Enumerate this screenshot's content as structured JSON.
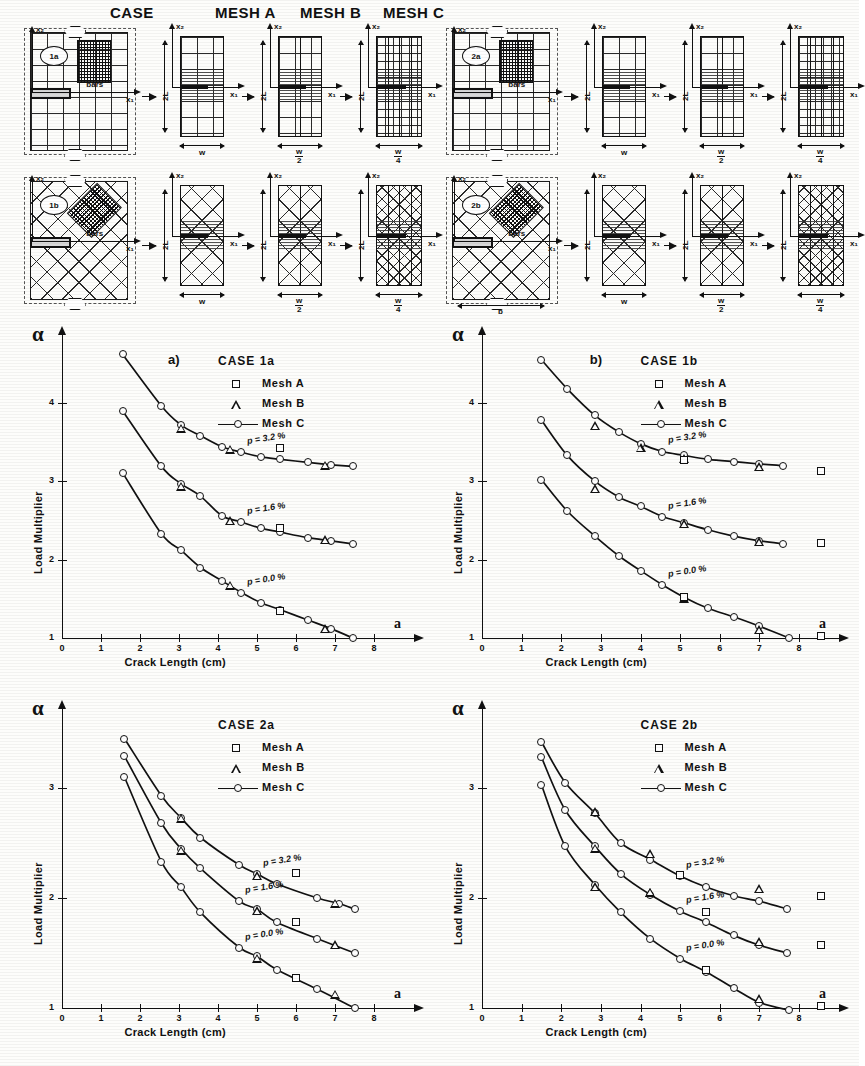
{
  "figure": {
    "headers": [
      "CASE",
      "MESH A",
      "MESH B",
      "MESH C"
    ],
    "case_labels": [
      "1a",
      "1b",
      "2a",
      "2b"
    ],
    "annotations": {
      "bars": "bars",
      "x1": "x₁",
      "x2": "x₂",
      "w": "w",
      "w_over_2_num": "w",
      "w_over_2_den": "2",
      "w_over_4_num": "w",
      "w_over_4_den": "4",
      "two_L": "2L",
      "b": "b"
    }
  },
  "charts": [
    {
      "panel_letter": "a)",
      "case_title": "CASE 1a",
      "alpha_symbol": "α",
      "x_axis_symbol": "a",
      "legend": [
        {
          "marker": "square",
          "label": "Mesh A"
        },
        {
          "marker": "triangle",
          "label": "Mesh B"
        },
        {
          "marker": "line-circle",
          "label": "Mesh C"
        }
      ],
      "chart_data": {
        "type": "line",
        "title": "CASE 1a",
        "xlabel": "Crack Length   (cm)",
        "ylabel": "Load Multiplier",
        "xlim": [
          0,
          8
        ],
        "ylim": [
          1,
          4.7
        ],
        "xticks": [
          0,
          1,
          2,
          3,
          4,
          5,
          6,
          7,
          8
        ],
        "yticks": [
          1,
          2,
          3,
          4
        ],
        "grid": false,
        "legend_position": "top-right",
        "series": [
          {
            "name": "p = 3.2%  Mesh C",
            "annotation": "p = 3.2 %",
            "marker": "circle",
            "x": [
              1.55,
              2.55,
              3.05,
              3.55,
              4.1,
              4.6,
              5.1,
              5.6,
              6.3,
              6.9,
              7.45
            ],
            "y": [
              4.62,
              3.96,
              3.72,
              3.58,
              3.44,
              3.37,
              3.31,
              3.28,
              3.24,
              3.21,
              3.19
            ]
          },
          {
            "name": "p = 3.2%  Mesh B",
            "marker": "triangle",
            "x": [
              3.05,
              4.3,
              6.75
            ],
            "y": [
              3.67,
              3.4,
              3.2
            ]
          },
          {
            "name": "p = 3.2%  Mesh A",
            "marker": "square",
            "x": [
              5.6
            ],
            "y": [
              3.42
            ]
          },
          {
            "name": "p = 1.6%  Mesh C",
            "annotation": "p = 1.6 %",
            "marker": "circle",
            "x": [
              1.55,
              2.55,
              3.05,
              3.55,
              4.1,
              4.6,
              5.1,
              5.6,
              6.3,
              6.9,
              7.45
            ],
            "y": [
              3.9,
              3.19,
              2.97,
              2.81,
              2.56,
              2.48,
              2.4,
              2.35,
              2.28,
              2.24,
              2.2
            ]
          },
          {
            "name": "p = 1.6%  Mesh B",
            "marker": "triangle",
            "x": [
              3.05,
              4.3,
              6.75
            ],
            "y": [
              2.93,
              2.49,
              2.25
            ]
          },
          {
            "name": "p = 1.6%  Mesh A",
            "marker": "square",
            "x": [
              5.6
            ],
            "y": [
              2.4
            ]
          },
          {
            "name": "p = 0.0%  Mesh C",
            "annotation": "p = 0.0 %",
            "marker": "circle",
            "x": [
              1.55,
              2.55,
              3.05,
              3.55,
              4.1,
              4.6,
              5.1,
              5.6,
              6.3,
              6.9,
              7.45
            ],
            "y": [
              3.11,
              2.33,
              2.12,
              1.9,
              1.73,
              1.58,
              1.45,
              1.36,
              1.23,
              1.12,
              1.0
            ]
          },
          {
            "name": "p = 0.0%  Mesh B",
            "marker": "triangle",
            "x": [
              4.3,
              6.75
            ],
            "y": [
              1.67,
              1.11
            ]
          },
          {
            "name": "p = 0.0%  Mesh A",
            "marker": "square",
            "x": [
              5.6
            ],
            "y": [
              1.35
            ]
          }
        ]
      }
    },
    {
      "panel_letter": "b)",
      "case_title": "CASE 1b",
      "alpha_symbol": "α",
      "x_axis_symbol": "a",
      "legend": [
        {
          "marker": "square",
          "label": "Mesh A"
        },
        {
          "marker": "triangle",
          "label": "Mesh B"
        },
        {
          "marker": "line-circle",
          "label": "Mesh C"
        }
      ],
      "chart_data": {
        "type": "line",
        "title": "CASE 1b",
        "xlabel": "Crack Length   (cm)",
        "ylabel": "Load Multiplier",
        "xlim": [
          0,
          8
        ],
        "ylim": [
          1,
          4.7
        ],
        "xticks": [
          0,
          1,
          2,
          3,
          4,
          5,
          6,
          7,
          8
        ],
        "yticks": [
          1,
          2,
          3,
          4
        ],
        "grid": false,
        "legend_position": "top-right",
        "series": [
          {
            "name": "p = 3.2%  Mesh C",
            "annotation": "p = 3.2 %",
            "marker": "circle",
            "x": [
              1.5,
              2.15,
              2.85,
              3.45,
              4.0,
              4.55,
              5.1,
              5.7,
              6.35,
              7.0,
              7.6
            ],
            "y": [
              4.55,
              4.18,
              3.84,
              3.63,
              3.48,
              3.38,
              3.33,
              3.28,
              3.25,
              3.22,
              3.2
            ]
          },
          {
            "name": "p = 3.2%  Mesh B",
            "marker": "triangle",
            "x": [
              2.85,
              4.0,
              5.1,
              7.0
            ],
            "y": [
              3.7,
              3.42,
              3.28,
              3.18
            ]
          },
          {
            "name": "p = 3.2%  Mesh A",
            "marker": "square",
            "x": [
              5.1,
              8.55
            ],
            "y": [
              3.27,
              3.13
            ]
          },
          {
            "name": "p = 1.6%  Mesh C",
            "annotation": "p = 1.6 %",
            "marker": "circle",
            "x": [
              1.5,
              2.15,
              2.85,
              3.45,
              4.0,
              4.55,
              5.1,
              5.7,
              6.35,
              7.0,
              7.6
            ],
            "y": [
              3.78,
              3.33,
              3.0,
              2.8,
              2.68,
              2.55,
              2.47,
              2.38,
              2.3,
              2.24,
              2.2
            ]
          },
          {
            "name": "p = 1.6%  Mesh B",
            "marker": "triangle",
            "x": [
              2.85,
              5.1,
              7.0
            ],
            "y": [
              2.9,
              2.45,
              2.22
            ]
          },
          {
            "name": "p = 1.6%  Mesh A",
            "marker": "square",
            "x": [
              8.55
            ],
            "y": [
              2.21
            ]
          },
          {
            "name": "p = 0.0%  Mesh C",
            "annotation": "p = 0.0 %",
            "marker": "circle",
            "x": [
              1.5,
              2.15,
              2.85,
              3.45,
              4.0,
              4.55,
              5.1,
              5.7,
              6.35,
              7.0,
              7.75
            ],
            "y": [
              3.02,
              2.62,
              2.3,
              2.05,
              1.86,
              1.68,
              1.52,
              1.38,
              1.27,
              1.15,
              1.0
            ]
          },
          {
            "name": "p = 0.0%  Mesh B",
            "marker": "triangle",
            "x": [
              5.1,
              7.0
            ],
            "y": [
              1.5,
              1.1
            ]
          },
          {
            "name": "p = 0.0%  Mesh A",
            "marker": "square",
            "x": [
              5.1,
              8.55
            ],
            "y": [
              1.53,
              1.02
            ]
          }
        ]
      }
    },
    {
      "panel_letter": "",
      "case_title": "CASE 2a",
      "alpha_symbol": "α",
      "x_axis_symbol": "a",
      "legend": [
        {
          "marker": "square",
          "label": "Mesh A"
        },
        {
          "marker": "triangle",
          "label": "Mesh B"
        },
        {
          "marker": "line-circle",
          "label": "Mesh C"
        }
      ],
      "chart_data": {
        "type": "line",
        "title": "CASE 2a",
        "xlabel": "Crack Length   (cm)",
        "ylabel": "Load Multiplier",
        "xlim": [
          0,
          8
        ],
        "ylim": [
          1,
          3.6
        ],
        "xticks": [
          0,
          1,
          2,
          3,
          4,
          5,
          6,
          7,
          8
        ],
        "yticks": [
          1,
          2,
          3
        ],
        "grid": false,
        "legend_position": "top-right",
        "series": [
          {
            "name": "p = 3.2%  Mesh C",
            "annotation": "p = 3.2 %",
            "marker": "circle",
            "x": [
              1.6,
              2.55,
              3.05,
              3.55,
              4.55,
              5.0,
              5.5,
              6.55,
              7.1,
              7.5
            ],
            "y": [
              3.45,
              2.93,
              2.73,
              2.55,
              2.3,
              2.22,
              2.13,
              2.0,
              1.95,
              1.9
            ]
          },
          {
            "name": "p = 3.2%  Mesh B",
            "marker": "triangle",
            "x": [
              3.05,
              5.0,
              7.0
            ],
            "y": [
              2.72,
              2.2,
              1.95
            ]
          },
          {
            "name": "p = 3.2%  Mesh A",
            "marker": "square",
            "x": [
              6.0
            ],
            "y": [
              2.23
            ]
          },
          {
            "name": "p = 1.6%  Mesh C",
            "annotation": "p = 1.6 %",
            "marker": "circle",
            "x": [
              1.6,
              2.55,
              3.05,
              3.55,
              4.55,
              5.0,
              5.5,
              6.55,
              7.5
            ],
            "y": [
              3.29,
              2.68,
              2.45,
              2.27,
              1.97,
              1.9,
              1.78,
              1.63,
              1.5
            ]
          },
          {
            "name": "p = 1.6%  Mesh B",
            "marker": "triangle",
            "x": [
              3.05,
              5.0,
              7.0
            ],
            "y": [
              2.43,
              1.88,
              1.57
            ]
          },
          {
            "name": "p = 1.6%  Mesh A",
            "marker": "square",
            "x": [
              6.0
            ],
            "y": [
              1.78
            ]
          },
          {
            "name": "p = 0.0%  Mesh C",
            "annotation": "p = 0.0 %",
            "marker": "circle",
            "x": [
              1.6,
              2.55,
              3.05,
              3.55,
              4.55,
              5.0,
              5.5,
              6.55,
              7.5
            ],
            "y": [
              3.1,
              2.33,
              2.1,
              1.87,
              1.55,
              1.47,
              1.35,
              1.17,
              1.0
            ]
          },
          {
            "name": "p = 0.0%  Mesh B",
            "marker": "triangle",
            "x": [
              5.0,
              7.0
            ],
            "y": [
              1.45,
              1.12
            ]
          },
          {
            "name": "p = 0.0%  Mesh A",
            "marker": "square",
            "x": [
              6.0
            ],
            "y": [
              1.27
            ]
          }
        ]
      }
    },
    {
      "panel_letter": "",
      "case_title": "CASE 2b",
      "alpha_symbol": "α",
      "x_axis_symbol": "a",
      "legend": [
        {
          "marker": "square",
          "label": "Mesh A"
        },
        {
          "marker": "triangle",
          "label": "Mesh B"
        },
        {
          "marker": "line-circle",
          "label": "Mesh C"
        }
      ],
      "chart_data": {
        "type": "line",
        "title": "CASE 2b",
        "xlabel": "Crack Length   (cm)",
        "ylabel": "Load Multiplier",
        "xlim": [
          0,
          8
        ],
        "ylim": [
          1,
          3.6
        ],
        "xticks": [
          0,
          1,
          2,
          3,
          4,
          5,
          6,
          7,
          8
        ],
        "yticks": [
          1,
          2,
          3
        ],
        "grid": false,
        "legend_position": "top-right",
        "series": [
          {
            "name": "p = 3.2%  Mesh C",
            "annotation": "p = 3.2 %",
            "marker": "circle",
            "x": [
              1.5,
              2.1,
              2.85,
              3.5,
              4.25,
              5.0,
              5.65,
              6.35,
              7.0,
              7.7
            ],
            "y": [
              3.42,
              3.05,
              2.77,
              2.5,
              2.35,
              2.2,
              2.1,
              2.02,
              1.97,
              1.9
            ]
          },
          {
            "name": "p = 3.2%  Mesh B",
            "marker": "triangle",
            "x": [
              2.85,
              4.25,
              7.0
            ],
            "y": [
              2.78,
              2.4,
              2.08
            ]
          },
          {
            "name": "p = 3.2%  Mesh A",
            "marker": "square",
            "x": [
              5.0,
              8.55
            ],
            "y": [
              2.21,
              2.02
            ]
          },
          {
            "name": "p = 1.6%  Mesh C",
            "annotation": "p = 1.6 %",
            "marker": "circle",
            "x": [
              1.5,
              2.1,
              2.85,
              3.5,
              4.25,
              5.0,
              5.65,
              6.35,
              7.0,
              7.7
            ],
            "y": [
              3.28,
              2.8,
              2.47,
              2.22,
              2.03,
              1.88,
              1.78,
              1.66,
              1.57,
              1.5
            ]
          },
          {
            "name": "p = 1.6%  Mesh B",
            "marker": "triangle",
            "x": [
              2.85,
              4.25,
              7.0
            ],
            "y": [
              2.45,
              2.05,
              1.6
            ]
          },
          {
            "name": "p = 1.6%  Mesh A",
            "marker": "square",
            "x": [
              5.65,
              8.55
            ],
            "y": [
              1.87,
              1.57
            ]
          },
          {
            "name": "p = 0.0%  Mesh C",
            "annotation": "p = 0.0 %",
            "marker": "circle",
            "x": [
              1.5,
              2.1,
              2.85,
              3.5,
              4.25,
              5.0,
              5.65,
              6.35,
              7.0,
              7.75
            ],
            "y": [
              3.03,
              2.47,
              2.12,
              1.87,
              1.63,
              1.45,
              1.33,
              1.18,
              1.05,
              0.98
            ]
          },
          {
            "name": "p = 0.0%  Mesh B",
            "marker": "triangle",
            "x": [
              2.85,
              4.25,
              7.0
            ],
            "y": [
              2.1,
              2.05,
              1.08
            ]
          },
          {
            "name": "p = 0.0%  Mesh A",
            "marker": "square",
            "x": [
              5.65,
              8.55
            ],
            "y": [
              1.35,
              1.02
            ]
          }
        ]
      }
    }
  ]
}
